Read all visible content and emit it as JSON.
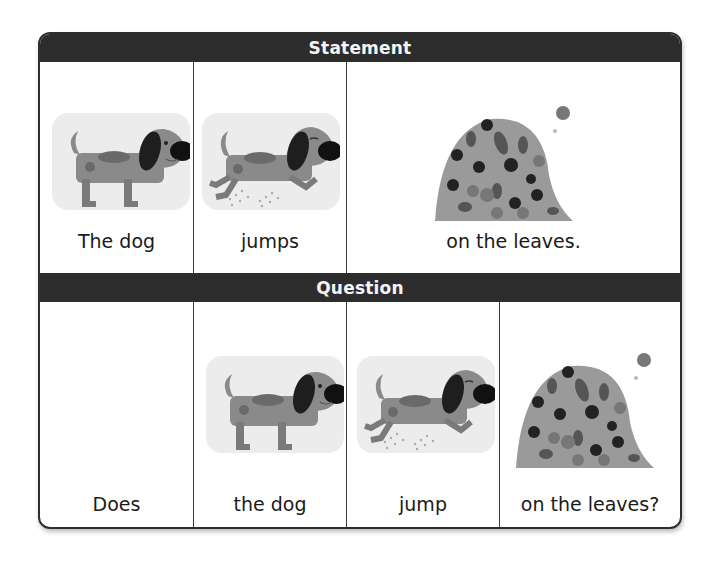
{
  "statement": {
    "title": "Statement",
    "cells": [
      {
        "label": "The dog",
        "image": "dog-standing"
      },
      {
        "label": "jumps",
        "image": "dog-jumping"
      },
      {
        "label": "on the leaves.",
        "image": "leaf-pile"
      }
    ]
  },
  "question": {
    "title": "Question",
    "cells": [
      {
        "label": "Does",
        "image": null
      },
      {
        "label": "the dog",
        "image": "dog-standing"
      },
      {
        "label": "jump",
        "image": "dog-jumping"
      },
      {
        "label": "on the leaves?",
        "image": "leaf-pile"
      }
    ]
  },
  "colors": {
    "header_bar": "#2d2d2d",
    "header_text": "#f4f4f4",
    "border": "#2e2e2e",
    "image_bg": "#ececec",
    "dog_body": "#8a8a8a",
    "dog_ear": "#1e1e1e"
  }
}
